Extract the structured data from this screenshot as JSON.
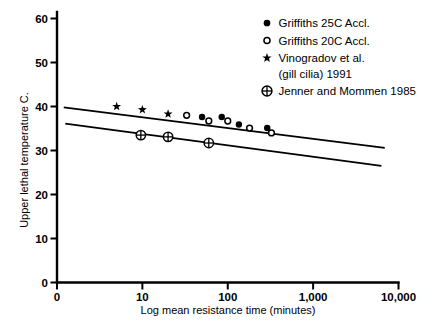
{
  "chart_data": {
    "type": "scatter",
    "title": "",
    "xlabel": "Log mean resistance time (minutes)",
    "ylabel": "Upper lethal temperature C.",
    "x_scale": "log",
    "y_scale": "linear",
    "xlim": [
      1,
      10000
    ],
    "ylim": [
      0,
      60
    ],
    "grid": false,
    "legend_position": "top-right",
    "x_ticks": [
      {
        "value": 1,
        "label": "0"
      },
      {
        "value": 10,
        "label": "10"
      },
      {
        "value": 100,
        "label": "100"
      },
      {
        "value": 1000,
        "label": "1,000"
      },
      {
        "value": 10000,
        "label": "10,000"
      }
    ],
    "y_ticks": [
      {
        "value": 0,
        "label": "0"
      },
      {
        "value": 10,
        "label": "10"
      },
      {
        "value": 20,
        "label": "20"
      },
      {
        "value": 30,
        "label": "30"
      },
      {
        "value": 40,
        "label": "40"
      },
      {
        "value": 50,
        "label": "50"
      },
      {
        "value": 60,
        "label": "60"
      }
    ],
    "series": [
      {
        "name": "Griffiths 25C Accl.",
        "marker": "filled-circle",
        "points": [
          [
            50,
            37.6
          ],
          [
            85,
            37.6
          ],
          [
            135,
            35.9
          ],
          [
            290,
            35.1
          ]
        ]
      },
      {
        "name": "Griffiths 20C Accl.",
        "marker": "open-circle",
        "points": [
          [
            33,
            38.0
          ],
          [
            60,
            36.7
          ],
          [
            100,
            36.7
          ],
          [
            180,
            35.1
          ],
          [
            325,
            34.0
          ]
        ]
      },
      {
        "name": "Vinogradov et al. (gill cilia) 1991",
        "marker": "asterisk",
        "points": [
          [
            5,
            40.0
          ],
          [
            10,
            39.3
          ],
          [
            20,
            38.3
          ]
        ]
      },
      {
        "name": "Jenner and Mommen 1985",
        "marker": "circle-plus",
        "points": [
          [
            9.6,
            33.5
          ],
          [
            20,
            33.1
          ],
          [
            60,
            31.7
          ]
        ]
      }
    ],
    "lines": [
      {
        "name": "upper-regression-line",
        "from": [
          1.2,
          39.8
        ],
        "to": [
          6900,
          30.6
        ]
      },
      {
        "name": "lower-regression-line",
        "from": [
          1.25,
          36.1
        ],
        "to": [
          6300,
          26.5
        ]
      }
    ],
    "legend": [
      {
        "marker": "filled-circle",
        "label_lines": [
          "Griffiths 25C Accl."
        ]
      },
      {
        "marker": "open-circle",
        "label_lines": [
          "Griffiths 20C Accl."
        ]
      },
      {
        "marker": "asterisk",
        "label_lines": [
          "Vinogradov et al.",
          "(gill cilia) 1991"
        ]
      },
      {
        "marker": "circle-plus",
        "label_lines": [
          "Jenner and Mommen 1985"
        ]
      }
    ],
    "colors": {
      "foreground": "#000000",
      "background": "#ffffff"
    }
  }
}
